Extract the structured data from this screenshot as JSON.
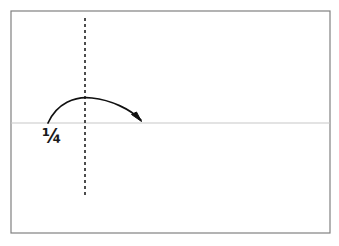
{
  "figure": {
    "kind": "paper-folding-instruction-diagram",
    "label": "¼",
    "background_color": "#ffffff",
    "sheet": {
      "name": "sheet-outline",
      "border_color": "#808080",
      "fill_color": "#ffffff",
      "x": 11,
      "y": 11,
      "width": 319,
      "height": 222,
      "stroke_width": 1.2
    },
    "fold_line_horizontal": {
      "name": "horizontal-crease-line",
      "color": "#c8c8c8",
      "y": 123,
      "x_start": 11,
      "x_end": 330,
      "stroke_width": 1.2,
      "style": "solid"
    },
    "fold_line_vertical": {
      "name": "vertical-dashed-guide",
      "color": "#3a3a3a",
      "x": 85,
      "y_start": 18,
      "y_end": 197,
      "stroke_width": 1.8,
      "style": "dashed",
      "dash_pattern": "3 3"
    },
    "fold_arrow": {
      "name": "fold-direction-arrow",
      "color": "#111111",
      "stroke_width": 1.7,
      "start_x": 48,
      "start_y": 123,
      "apex_x": 88,
      "apex_y": 97,
      "end_x": 142,
      "end_y": 121,
      "path": "M 48 123 C 57 103, 75 96, 92 98 C 111 100, 130 109, 141 120",
      "arrowhead": "M 141.5 121.5 L 131.5 114.5 L 136.5 112 Z"
    }
  }
}
